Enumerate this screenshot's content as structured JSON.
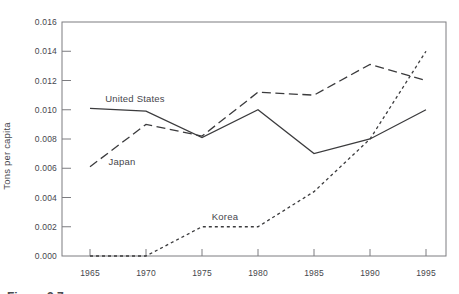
{
  "figure": {
    "caption_prefix": "Figure 3.7"
  },
  "chart_data": {
    "type": "line",
    "title": "",
    "xlabel": "",
    "ylabel": "Tons per capita",
    "x": [
      1965,
      1970,
      1975,
      1980,
      1985,
      1990,
      1995
    ],
    "xtick_labels": [
      "1965",
      "1970",
      "1975",
      "1980",
      "1985",
      "1990",
      "1995"
    ],
    "ylim": [
      0,
      0.016
    ],
    "ytick_step": 0.002,
    "ytick_labels": [
      "0.000",
      "0.002",
      "0.004",
      "0.006",
      "0.008",
      "0.010",
      "0.012",
      "0.014",
      "0.016"
    ],
    "grid": false,
    "legend_position": "inline-labels",
    "frame": "full-box",
    "series": [
      {
        "name": "United States",
        "label": "United States",
        "line_style": "solid",
        "values": [
          0.0101,
          0.0099,
          0.0081,
          0.01,
          0.007,
          0.008,
          0.01
        ],
        "label_px": {
          "x": 135,
          "y": 102
        }
      },
      {
        "name": "Japan",
        "label": "Japan",
        "line_style": "long-dash",
        "values": [
          0.0061,
          0.009,
          0.0082,
          0.0112,
          0.011,
          0.0131,
          0.012
        ],
        "label_px": {
          "x": 122,
          "y": 165
        }
      },
      {
        "name": "Korea",
        "label": "Korea",
        "line_style": "short-dash",
        "values": [
          0.0,
          0.0,
          0.002,
          0.002,
          0.0044,
          0.008,
          0.014
        ],
        "label_px": {
          "x": 225,
          "y": 220
        }
      }
    ],
    "colors": {
      "line": "#3b3b3d",
      "frame": "#7c7c80",
      "text": "#46464c"
    }
  }
}
